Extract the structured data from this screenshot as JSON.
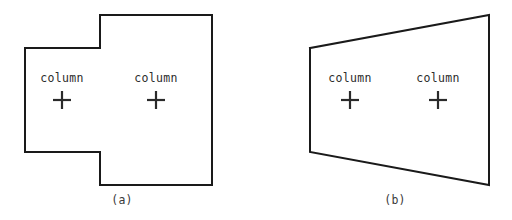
{
  "figure": {
    "background_color": "#ffffff",
    "stroke_color": "#1a1a1a",
    "text_color": "#2b2b2b",
    "panels": [
      {
        "id": "a",
        "caption": "(a)",
        "caption_x": 122,
        "caption_y": 200,
        "shape_type": "l-shaped-stepped-polygon",
        "outline_points": "25,48 100,48 100,15 212,15 212,185 100,185 100,152 25,152 25,48",
        "labels": [
          {
            "text": "column",
            "x": 62,
            "y": 78
          },
          {
            "text": "column",
            "x": 156,
            "y": 78
          }
        ],
        "crosses": [
          {
            "x": 62,
            "y": 100,
            "size": 9
          },
          {
            "x": 156,
            "y": 100,
            "size": 9
          }
        ]
      },
      {
        "id": "b",
        "caption": "(b)",
        "caption_x": 395,
        "caption_y": 200,
        "shape_type": "trapezoid-quadrilateral",
        "outline_points": "310,48 489,15 489,185 310,152 310,48",
        "labels": [
          {
            "text": "column",
            "x": 350,
            "y": 78
          },
          {
            "text": "column",
            "x": 438,
            "y": 78
          }
        ],
        "crosses": [
          {
            "x": 350,
            "y": 100,
            "size": 9
          },
          {
            "x": 438,
            "y": 100,
            "size": 9
          }
        ]
      }
    ]
  }
}
